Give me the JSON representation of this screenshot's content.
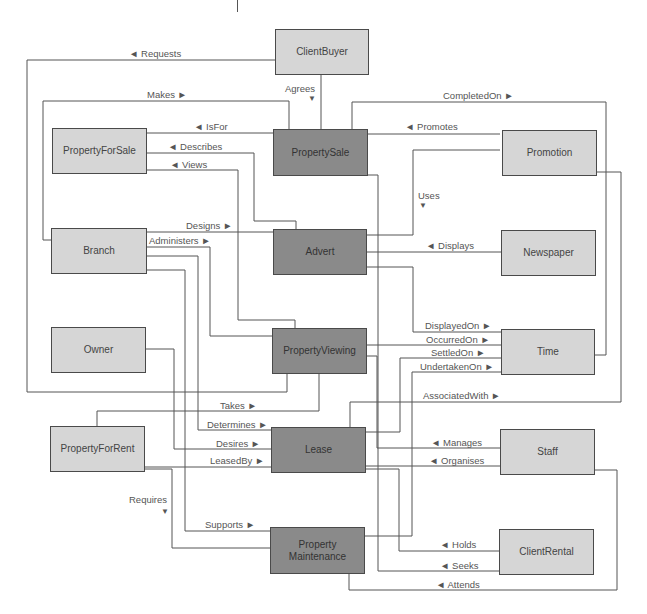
{
  "diagram": {
    "type": "entity-relationship",
    "colors": {
      "line": "#555555",
      "entity_light": "#d6d6d6",
      "entity_dark": "#8a8a8a",
      "border": "#4a4a4a",
      "text": "#444444"
    },
    "entities": {
      "client_buyer": "ClientBuyer",
      "property_for_sale": "PropertyForSale",
      "property_sale": "PropertySale",
      "promotion": "Promotion",
      "branch": "Branch",
      "advert": "Advert",
      "newspaper": "Newspaper",
      "owner": "Owner",
      "property_viewing": "PropertyViewing",
      "time": "Time",
      "property_for_rent": "PropertyForRent",
      "lease": "Lease",
      "staff": "Staff",
      "property_maintenance": "Property Maintenance",
      "client_rental": "ClientRental"
    },
    "relationships": {
      "requests": "◄ Requests",
      "agrees": "Agrees",
      "agrees_arrow": "▼",
      "makes": "Makes ►",
      "completed_on": "CompletedOn ►",
      "is_for": "◄ IsFor",
      "promotes": "◄ Promotes",
      "describes": "◄ Describes",
      "views": "◄ Views",
      "uses": "Uses",
      "uses_arrow": "▼",
      "designs": "Designs ►",
      "administers": "Administers ►",
      "displays": "◄ Displays",
      "displayed_on": "DisplayedOn ►",
      "occurred_on": "OccurredOn ►",
      "settled_on": "SettledOn ►",
      "undertaken_on": "UndertakenOn ►",
      "associated_with": "AssociatedWith ►",
      "takes": "Takes ►",
      "determines": "Determines ►",
      "desires": "Desires ►",
      "leased_by": "LeasedBy ►",
      "manages": "◄ Manages",
      "organises": "◄ Organises",
      "requires": "Requires",
      "requires_arrow": "▼",
      "supports": "Supports ►",
      "holds": "◄ Holds",
      "seeks": "◄ Seeks",
      "attends": "◄ Attends"
    }
  }
}
